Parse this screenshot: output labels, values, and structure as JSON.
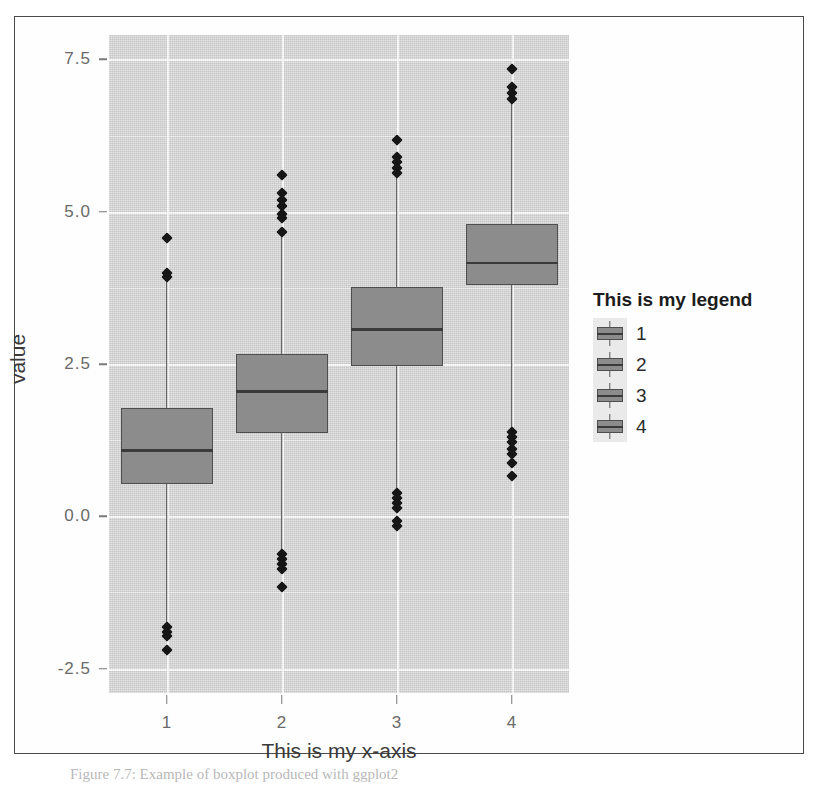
{
  "figure": {
    "caption": "Figure 7.7: Example of boxplot produced with ggplot2"
  },
  "chart_data": {
    "type": "box",
    "title": "",
    "xlabel": "This is my x-axis",
    "ylabel": "value",
    "categories": [
      "1",
      "2",
      "3",
      "4"
    ],
    "ylim": [
      -2.9,
      7.9
    ],
    "yticks": [
      -2.5,
      0.0,
      2.5,
      5.0,
      7.5
    ],
    "ytick_labels": [
      "-2.5",
      "0.0",
      "2.5",
      "5.0",
      "7.5"
    ],
    "xtick_labels": [
      "1",
      "2",
      "3",
      "4"
    ],
    "grid": true,
    "panel_background": "#d4d4d4",
    "grid_major_color": "#fbfbfb",
    "box_fill": "#8c8c8c",
    "box_line": "#4e4e4e",
    "outlier_color": "#161616",
    "legend": {
      "title": "This is my legend",
      "position": "right",
      "entries": [
        "1",
        "2",
        "3",
        "4"
      ]
    },
    "series": [
      {
        "name": "1",
        "q1": 0.53,
        "median": 1.08,
        "q3": 1.77,
        "whisker_low": -1.75,
        "whisker_high": 4.08,
        "outliers": [
          4.57,
          4.0,
          3.92,
          -1.82,
          -1.9,
          -1.97,
          -2.2
        ]
      },
      {
        "name": "2",
        "q1": 1.37,
        "median": 2.05,
        "q3": 2.66,
        "whisker_low": -0.6,
        "whisker_high": 4.62,
        "outliers": [
          5.6,
          5.3,
          5.2,
          5.1,
          4.97,
          4.9,
          4.67,
          -0.62,
          -0.7,
          -0.78,
          -0.86,
          -1.16
        ]
      },
      {
        "name": "3",
        "q1": 2.47,
        "median": 3.07,
        "q3": 3.76,
        "whisker_low": 0.42,
        "whisker_high": 5.62,
        "outliers": [
          6.18,
          5.9,
          5.82,
          5.72,
          5.63,
          0.38,
          0.3,
          0.22,
          0.14,
          -0.08,
          -0.16
        ]
      },
      {
        "name": "4",
        "q1": 3.79,
        "median": 4.16,
        "q3": 4.79,
        "whisker_low": 1.32,
        "whisker_high": 6.82,
        "outliers": [
          7.35,
          7.05,
          6.95,
          6.85,
          1.38,
          1.3,
          1.22,
          1.1,
          1.02,
          0.88,
          0.66
        ]
      }
    ]
  }
}
